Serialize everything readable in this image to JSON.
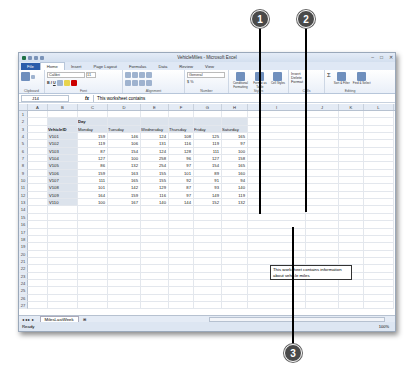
{
  "window": {
    "title": "VehicleMiles - Microsoft Excel",
    "controls": [
      "–",
      "□",
      "✕"
    ]
  },
  "ribbon": {
    "tabs": [
      "File",
      "Home",
      "Insert",
      "Page Layout",
      "Formulas",
      "Data",
      "Review",
      "View"
    ],
    "active_tab": "Home",
    "groups": {
      "clipboard": {
        "label": "Clipboard",
        "paste": "Paste"
      },
      "font": {
        "label": "Font",
        "name": "Calibri",
        "size": "11"
      },
      "alignment": {
        "label": "Alignment"
      },
      "number": {
        "label": "Number",
        "format": "General",
        "currency": "$",
        "percent": "%"
      },
      "styles": {
        "label": "Styles",
        "conditional": "Conditional Formatting",
        "format_table": "Format as Table",
        "cell_styles": "Cell Styles"
      },
      "cells": {
        "label": "Cells",
        "insert": "Insert",
        "delete": "Delete",
        "format": "Format"
      },
      "editing": {
        "label": "Editing",
        "sort": "Sort & Filter",
        "find": "Find & Select"
      }
    }
  },
  "formula_bar": {
    "name_box": "J14",
    "fx": "fx",
    "content": "This worksheet contains"
  },
  "columns": [
    "A",
    "B",
    "C",
    "D",
    "E",
    "F",
    "G",
    "H",
    "I",
    "J",
    "K",
    "L"
  ],
  "table": {
    "group_header": "Day",
    "id_header": "VehicleID",
    "days": [
      "Monday",
      "Tuesday",
      "Wednesday",
      "Thursday",
      "Friday",
      "Saturday"
    ],
    "rows": [
      {
        "id": "V101",
        "values": [
          159,
          146,
          124,
          108,
          125,
          165
        ]
      },
      {
        "id": "V102",
        "values": [
          119,
          106,
          131,
          116,
          119,
          97
        ]
      },
      {
        "id": "V103",
        "values": [
          87,
          154,
          124,
          128,
          111,
          100
        ]
      },
      {
        "id": "V104",
        "values": [
          127,
          100,
          258,
          96,
          127,
          158
        ]
      },
      {
        "id": "V105",
        "values": [
          86,
          132,
          254,
          97,
          154,
          165
        ]
      },
      {
        "id": "V106",
        "values": [
          159,
          163,
          155,
          101,
          89,
          160
        ]
      },
      {
        "id": "V107",
        "values": [
          111,
          165,
          155,
          92,
          91,
          94
        ]
      },
      {
        "id": "V108",
        "values": [
          101,
          142,
          129,
          87,
          93,
          140
        ]
      },
      {
        "id": "V109",
        "values": [
          164,
          159,
          116,
          97,
          149,
          119
        ]
      },
      {
        "id": "V110",
        "values": [
          100,
          167,
          140,
          144,
          152,
          132
        ]
      }
    ]
  },
  "comment_box": {
    "text": "This worksheet contains information about vehicle miles"
  },
  "sheet_tabs": [
    "MilesLastWeek"
  ],
  "status": {
    "mode": "Ready",
    "zoom": "100%"
  },
  "callouts": [
    "1",
    "2",
    "3"
  ]
}
